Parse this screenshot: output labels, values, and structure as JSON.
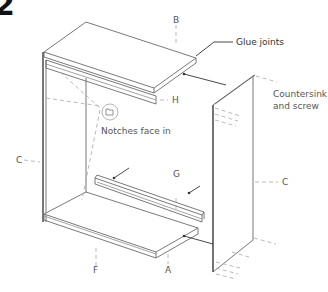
{
  "step_number": "2",
  "annotations": {
    "glue_joints": "Glue joints",
    "countersink_line1": "Countersink",
    "countersink_line2": "and screw",
    "notches": "Notches face in"
  },
  "part_labels": {
    "B": "B",
    "H": "H",
    "C_left": "C",
    "C_right": "C",
    "G": "G",
    "F": "F",
    "A": "A"
  },
  "colors": {
    "line": "#6a6a6a",
    "dash": "#a8a8a8",
    "text": "#555555",
    "step": "#111111"
  }
}
